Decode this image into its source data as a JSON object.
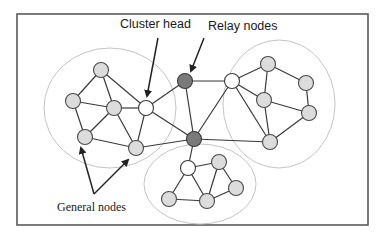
{
  "diagram": {
    "type": "clustered-network",
    "labels": {
      "cluster_head": "Cluster head",
      "relay_nodes": "Relay nodes",
      "general_nodes": "General nodes"
    },
    "colors": {
      "general_node_fill": "#dcdcdc",
      "cluster_head_fill": "#ffffff",
      "relay_node_fill": "#7a7a7a",
      "cluster_outline": "#c4c4c4",
      "frame": "#5a5a5a"
    },
    "clusters": [
      {
        "id": "left",
        "cx": 110,
        "cy": 108,
        "rx": 66,
        "ry": 60
      },
      {
        "id": "right",
        "cx": 279,
        "cy": 104,
        "rx": 56,
        "ry": 64
      },
      {
        "id": "bottom",
        "cx": 200,
        "cy": 184,
        "rx": 56,
        "ry": 40
      }
    ],
    "nodes": [
      {
        "id": "A",
        "type": "general",
        "x": 101,
        "y": 70
      },
      {
        "id": "B",
        "type": "general",
        "x": 73,
        "y": 101
      },
      {
        "id": "C",
        "type": "general",
        "x": 114,
        "y": 108
      },
      {
        "id": "CH1",
        "type": "cluster-head",
        "x": 146,
        "y": 108
      },
      {
        "id": "D",
        "type": "general",
        "x": 85,
        "y": 137
      },
      {
        "id": "E",
        "type": "general",
        "x": 136,
        "y": 148
      },
      {
        "id": "R1",
        "type": "relay",
        "x": 185,
        "y": 81
      },
      {
        "id": "R2",
        "type": "relay",
        "x": 194,
        "y": 139
      },
      {
        "id": "CH2",
        "type": "cluster-head",
        "x": 232,
        "y": 81
      },
      {
        "id": "F",
        "type": "general",
        "x": 268,
        "y": 64
      },
      {
        "id": "G",
        "type": "general",
        "x": 306,
        "y": 83
      },
      {
        "id": "H",
        "type": "general",
        "x": 264,
        "y": 100
      },
      {
        "id": "I",
        "type": "general",
        "x": 309,
        "y": 113
      },
      {
        "id": "J",
        "type": "general",
        "x": 270,
        "y": 142
      },
      {
        "id": "CH3",
        "type": "cluster-head",
        "x": 188,
        "y": 168
      },
      {
        "id": "K",
        "type": "general",
        "x": 219,
        "y": 162
      },
      {
        "id": "M",
        "type": "general",
        "x": 236,
        "y": 188
      },
      {
        "id": "N",
        "type": "general",
        "x": 207,
        "y": 201
      },
      {
        "id": "O",
        "type": "general",
        "x": 169,
        "y": 199
      }
    ],
    "edges": [
      [
        "A",
        "B"
      ],
      [
        "A",
        "C"
      ],
      [
        "A",
        "CH1"
      ],
      [
        "B",
        "C"
      ],
      [
        "B",
        "D"
      ],
      [
        "C",
        "D"
      ],
      [
        "C",
        "CH1"
      ],
      [
        "C",
        "E"
      ],
      [
        "D",
        "E"
      ],
      [
        "CH1",
        "E"
      ],
      [
        "CH1",
        "R1"
      ],
      [
        "CH1",
        "R2"
      ],
      [
        "E",
        "R2"
      ],
      [
        "R1",
        "CH2"
      ],
      [
        "R1",
        "R2"
      ],
      [
        "R2",
        "CH2"
      ],
      [
        "R2",
        "J"
      ],
      [
        "R2",
        "CH3"
      ],
      [
        "CH2",
        "F"
      ],
      [
        "CH2",
        "H"
      ],
      [
        "CH2",
        "J"
      ],
      [
        "F",
        "H"
      ],
      [
        "F",
        "G"
      ],
      [
        "G",
        "I"
      ],
      [
        "H",
        "I"
      ],
      [
        "H",
        "J"
      ],
      [
        "I",
        "J"
      ],
      [
        "CH3",
        "K"
      ],
      [
        "CH3",
        "O"
      ],
      [
        "CH3",
        "N"
      ],
      [
        "K",
        "N"
      ],
      [
        "K",
        "M"
      ],
      [
        "M",
        "N"
      ],
      [
        "O",
        "N"
      ]
    ],
    "annotations": [
      {
        "label_key": "cluster_head",
        "text_x": 147,
        "text_y": 28,
        "arrows": [
          {
            "x1": 158,
            "y1": 38,
            "x2": 147,
            "y2": 96
          }
        ]
      },
      {
        "label_key": "relay_nodes",
        "text_x": 208,
        "text_y": 30,
        "arrows": [
          {
            "x1": 204,
            "y1": 38,
            "x2": 191,
            "y2": 71
          }
        ]
      },
      {
        "label_key": "general_nodes",
        "text_x": 57,
        "text_y": 211,
        "arrows": [
          {
            "x1": 94,
            "y1": 194,
            "x2": 81,
            "y2": 148
          },
          {
            "x1": 94,
            "y1": 194,
            "x2": 128,
            "y2": 160
          }
        ]
      }
    ]
  }
}
